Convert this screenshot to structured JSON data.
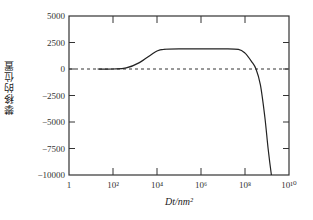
{
  "chart_data": {
    "type": "line",
    "title": "",
    "xlabel": "Dt/nm²",
    "ylabel": "攀移的位置",
    "xscale": "log",
    "xlim": [
      1,
      10000000000
    ],
    "ylim": [
      -10000,
      5000
    ],
    "x_ticks": [
      {
        "value": 1,
        "label": "1"
      },
      {
        "value": 100,
        "label": "10²"
      },
      {
        "value": 10000,
        "label": "10⁴"
      },
      {
        "value": 1000000,
        "label": "10⁶"
      },
      {
        "value": 100000000,
        "label": "10⁸"
      },
      {
        "value": 10000000000,
        "label": "10¹⁰"
      }
    ],
    "y_ticks": [
      5000,
      2500,
      0,
      -2500,
      -5000,
      -7500,
      -10000
    ],
    "y_tick_labels": [
      "5000",
      "2500",
      "0",
      "−2500",
      "−5000",
      "−7500",
      "−10000"
    ],
    "grid": false,
    "legend": null,
    "reference_line": {
      "y": 0,
      "style": "dashed"
    },
    "series": [
      {
        "name": "climb position",
        "log10_x": [
          1.3,
          2.0,
          2.6,
          3.2,
          3.7,
          4.0,
          4.3,
          5.0,
          6.0,
          7.0,
          7.7,
          8.0,
          8.3,
          8.5,
          8.7,
          8.9,
          9.05,
          9.2
        ],
        "values": [
          0,
          0,
          100,
          600,
          1300,
          1700,
          1850,
          1900,
          1900,
          1900,
          1850,
          1500,
          700,
          0,
          -1500,
          -4500,
          -7500,
          -10000
        ]
      }
    ]
  }
}
